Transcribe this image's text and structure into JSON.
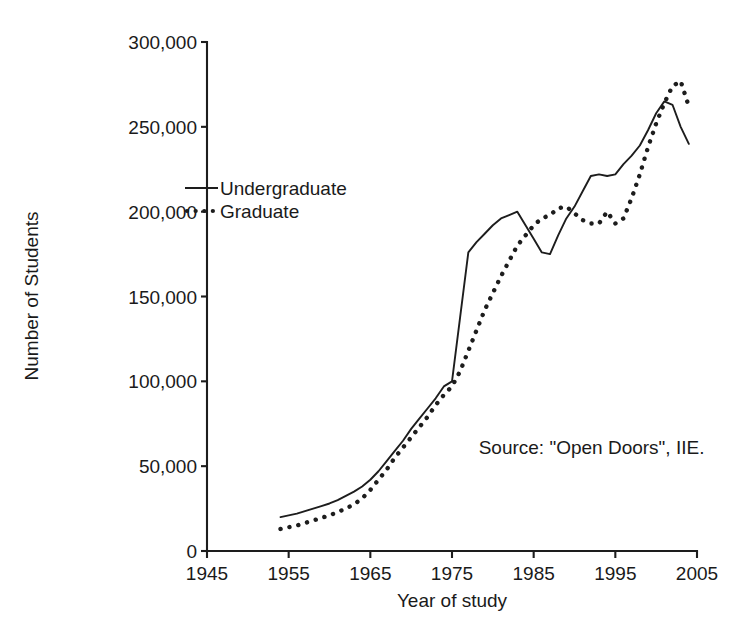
{
  "chart_data": {
    "type": "line",
    "title": "",
    "xlabel": "Year of study",
    "ylabel": "Number of Students",
    "xlim": [
      1945,
      2005
    ],
    "ylim": [
      0,
      300000
    ],
    "grid": false,
    "legend_position": "upper-left-inside",
    "x_ticks": [
      "1945",
      "1955",
      "1965",
      "1975",
      "1985",
      "1995",
      "2005"
    ],
    "y_ticks": [
      "0",
      "50,000",
      "100,000",
      "150,000",
      "200,000",
      "250,000",
      "300,000"
    ],
    "x_tick_values": [
      1945,
      1955,
      1965,
      1975,
      1985,
      1995,
      2005
    ],
    "y_tick_values": [
      0,
      50000,
      100000,
      150000,
      200000,
      250000,
      300000
    ],
    "annotations": [
      {
        "text": "Source: \"Open Doors\", IIE.",
        "x": 1985,
        "y": 57000
      }
    ],
    "series": [
      {
        "name": "Undergraduate",
        "style": "solid",
        "x": [
          1954,
          1955,
          1956,
          1957,
          1958,
          1959,
          1960,
          1961,
          1962,
          1963,
          1964,
          1965,
          1966,
          1967,
          1968,
          1969,
          1970,
          1971,
          1972,
          1973,
          1974,
          1975,
          1976,
          1977,
          1978,
          1979,
          1980,
          1981,
          1982,
          1983,
          1984,
          1985,
          1986,
          1987,
          1988,
          1989,
          1990,
          1991,
          1992,
          1993,
          1994,
          1995,
          1996,
          1997,
          1998,
          1999,
          2000,
          2001,
          2002,
          2003,
          2004
        ],
        "values": [
          20000,
          21000,
          22000,
          23500,
          25000,
          26500,
          28000,
          30000,
          32500,
          35000,
          38000,
          42000,
          47000,
          53000,
          59000,
          65000,
          72000,
          78000,
          84000,
          90000,
          97000,
          100000,
          138000,
          176000,
          182000,
          187000,
          192000,
          196000,
          198000,
          200000,
          192000,
          184000,
          176000,
          175000,
          186000,
          196000,
          203000,
          212000,
          221000,
          222000,
          221000,
          222000,
          228000,
          233000,
          239000,
          248000,
          258000,
          265000,
          263000,
          250000,
          240000
        ]
      },
      {
        "name": "Graduate",
        "style": "dotted",
        "x": [
          1954,
          1955,
          1956,
          1957,
          1958,
          1959,
          1960,
          1961,
          1962,
          1963,
          1964,
          1965,
          1966,
          1967,
          1968,
          1969,
          1970,
          1971,
          1972,
          1973,
          1974,
          1975,
          1976,
          1977,
          1978,
          1979,
          1980,
          1981,
          1982,
          1983,
          1984,
          1985,
          1986,
          1987,
          1988,
          1989,
          1990,
          1991,
          1992,
          1993,
          1994,
          1995,
          1996,
          1997,
          1998,
          1999,
          2000,
          2001,
          2002,
          2003,
          2004
        ],
        "values": [
          13000,
          14000,
          15000,
          16500,
          18000,
          19500,
          21000,
          23000,
          25000,
          27500,
          31000,
          36000,
          42000,
          48000,
          55000,
          61000,
          67000,
          73000,
          79000,
          86000,
          92000,
          97000,
          106000,
          118000,
          130000,
          142000,
          152000,
          162000,
          171000,
          180000,
          186000,
          192000,
          196000,
          198000,
          202000,
          203000,
          199000,
          195000,
          193000,
          193000,
          200000,
          193000,
          196000,
          208000,
          222000,
          238000,
          252000,
          264000,
          274000,
          277000,
          262000
        ]
      }
    ]
  },
  "legend": {
    "items": [
      {
        "label": "Undergraduate",
        "style": "solid"
      },
      {
        "label": "Graduate",
        "style": "dotted"
      }
    ]
  },
  "axes": {
    "x_title": "Year of study",
    "y_title": "Number of Students"
  },
  "source": {
    "text": "Source: \"Open Doors\", IIE."
  }
}
